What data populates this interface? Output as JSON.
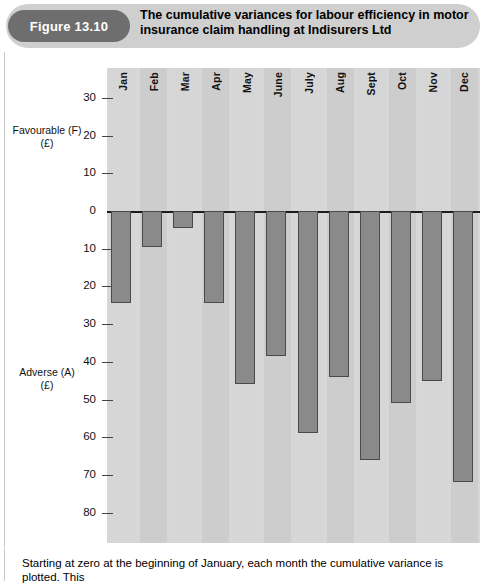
{
  "figure": {
    "badge_label": "Figure 13.10",
    "title": "The cumulative variances for labour efficiency in motor insurance claim handling at Indisurers Ltd"
  },
  "axis": {
    "favourable_caption_line1": "Favourable (F)",
    "favourable_caption_line2": "(£)",
    "adverse_caption_line1": "Adverse (A)",
    "adverse_caption_line2": "(£)",
    "ticks": [
      "30",
      "20",
      "10",
      "0",
      "10",
      "20",
      "30",
      "40",
      "50",
      "60",
      "70",
      "80"
    ]
  },
  "footer": {
    "text": "Starting at zero at the beginning of January, each month the cumulative variance is plotted. This"
  },
  "colors": {
    "badge_bg": "#6e6e6e",
    "header_pill_bg": "#cfcfcf",
    "plot_bg": "#d7d7d7",
    "bar_fill": "#8a8a8a",
    "bar_stroke": "#4a4a4a",
    "zero_line": "#1c1c1c"
  },
  "chart_data": {
    "type": "bar",
    "title": "The cumulative variances for labour efficiency in motor insurance claim handling at Indisurers Ltd",
    "xlabel": "",
    "ylabel": "Cumulative variance (£)",
    "grid": false,
    "legend": "none",
    "orientation": "vertical",
    "note": "Values are adverse (A) cumulative variances, plotted downward from zero. Axis is inverted: favourable (F) above zero, adverse (A) below zero.",
    "ylim_favourable_max": 35,
    "ylim_adverse_max": 85,
    "y_ticks_favourable": [
      30,
      20,
      10,
      0
    ],
    "y_ticks_adverse": [
      10,
      20,
      30,
      40,
      50,
      60,
      70,
      80
    ],
    "categories": [
      "Jan",
      "Feb",
      "Mar",
      "Apr",
      "May",
      "June",
      "July",
      "Aug",
      "Sept",
      "Oct",
      "Nov",
      "Dec"
    ],
    "values": [
      -24.5,
      -9.5,
      -4.5,
      -24.5,
      -46,
      -38.5,
      -59,
      -44,
      -66,
      -51,
      -45,
      -72
    ],
    "values_adverse_magnitude": [
      24.5,
      9.5,
      4.5,
      24.5,
      46,
      38.5,
      59,
      44,
      66,
      51,
      45,
      72
    ]
  }
}
